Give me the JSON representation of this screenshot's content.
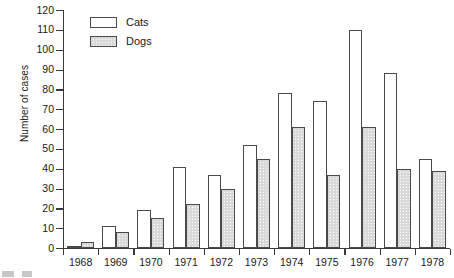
{
  "chart_data": {
    "type": "bar",
    "title": "",
    "xlabel": "",
    "ylabel": "Number of cases",
    "categories": [
      "1968",
      "1969",
      "1970",
      "1971",
      "1972",
      "1973",
      "1974",
      "1975",
      "1976",
      "1977",
      "1978"
    ],
    "series": [
      {
        "name": "Cats",
        "color": "#ffffff",
        "values": [
          1,
          11,
          19,
          41,
          37,
          52,
          78,
          74,
          110,
          88,
          45
        ]
      },
      {
        "name": "Dogs",
        "color": "#d9d9d9",
        "values": [
          3,
          8,
          15,
          22,
          30,
          45,
          61,
          37,
          61,
          40,
          39
        ]
      }
    ],
    "ylim": [
      0,
      120
    ],
    "ytick_values": [
      0,
      10,
      20,
      30,
      40,
      50,
      60,
      70,
      80,
      90,
      100,
      110,
      120
    ],
    "ytick_labels": [
      "0",
      "10",
      "20",
      "30",
      "40",
      "50",
      "60",
      "70",
      "80",
      "90",
      "100",
      "110",
      "120"
    ],
    "grid": false,
    "legend_position": "top-left",
    "legend_entries": [
      "Cats",
      "Dogs"
    ]
  },
  "axes": {
    "y_title": "Number of cases"
  }
}
